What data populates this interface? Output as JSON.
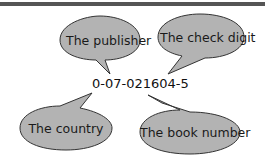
{
  "diagram": {
    "isbn": "0-07-021604-5",
    "bubbles": [
      {
        "label": "The publisher"
      },
      {
        "label": "The check digit"
      },
      {
        "label": "The country"
      },
      {
        "label": "The book number"
      }
    ]
  },
  "colors": {
    "bubble_fill": "#b3b3b3",
    "bubble_stroke": "#333333",
    "top_bar": "#555555"
  }
}
